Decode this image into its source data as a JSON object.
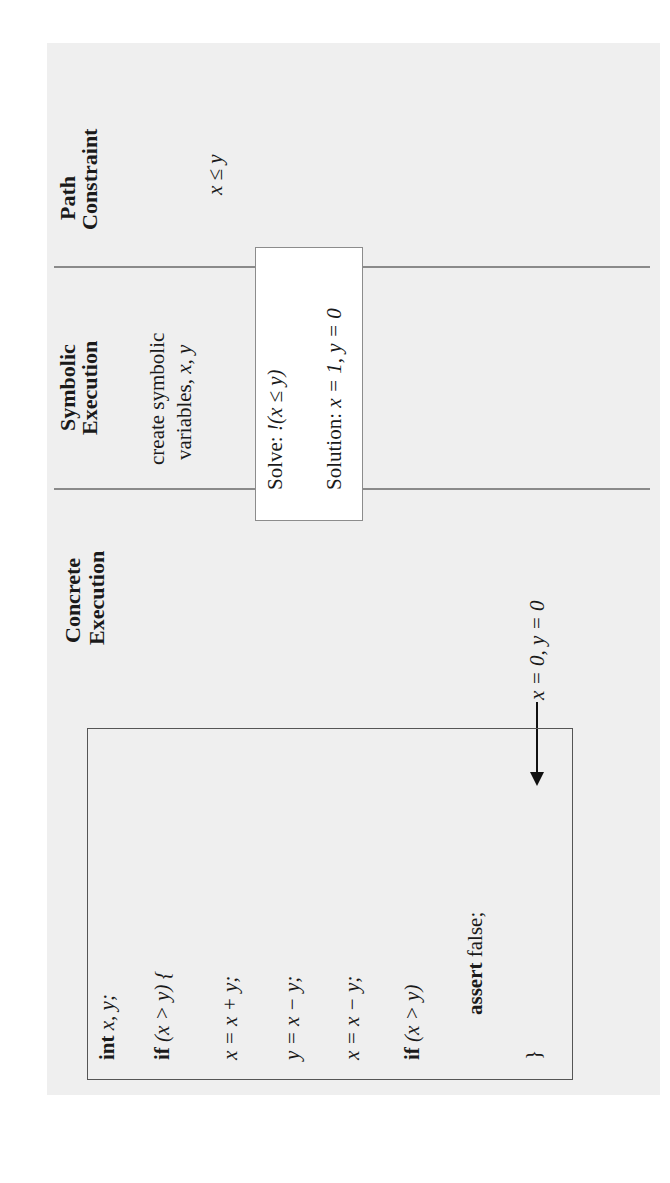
{
  "columns": {
    "path_constraint": {
      "heading_line1": "Path",
      "heading_line2": "Constraint",
      "value": "x ≤ y"
    },
    "symbolic_execution": {
      "heading_line1": "Symbolic",
      "heading_line2": "Execution",
      "note_line1": "create symbolic",
      "note_line2_prefix": "variables, ",
      "note_line2_vars": "x, y"
    },
    "concrete_execution": {
      "heading_line1": "Concrete",
      "heading_line2": "Execution",
      "input": "x = 0, y = 0"
    }
  },
  "solver_box": {
    "solve_label": "Solve: ",
    "solve_expr": "!(x ≤ y)",
    "solution_label": "Solution: ",
    "solution_value": "x = 1, y = 0"
  },
  "code": {
    "lines": [
      {
        "kw": "int",
        "rest": " x, y;"
      },
      {
        "kw": "if",
        "rest": " (x > y) {"
      },
      {
        "kw": "",
        "rest": "x = x + y;"
      },
      {
        "kw": "",
        "rest": "y = x − y;"
      },
      {
        "kw": "",
        "rest": "x = x − y;"
      },
      {
        "kw": "if",
        "rest": " (x > y)"
      },
      {
        "kw": "assert",
        "rest": " false;"
      },
      {
        "kw": "",
        "rest": "}"
      }
    ]
  },
  "colors": {
    "paper": "#efefef",
    "rule": "#8a8a8a",
    "ink": "#1a1a1a"
  }
}
